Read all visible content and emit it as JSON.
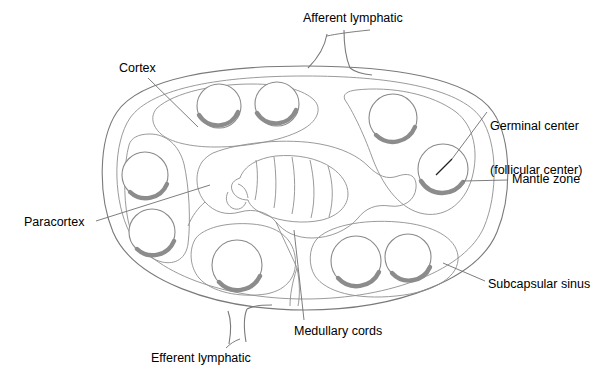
{
  "figure": {
    "background_color": "#ffffff",
    "outline_color": "#7a7a7a",
    "shading_color": "#8c8c8c",
    "text_color": "#000000"
  },
  "labels": {
    "afferent_lymphatic": "Afferent lymphatic",
    "cortex": "Cortex",
    "germinal_center_line1": "Germinal center",
    "germinal_center_line2": "(follicular center)",
    "mantle_zone": "Mantle zone",
    "paracortex": "Paracortex",
    "subcapsular_sinus": "Subcapsular sinus",
    "medullary_cords": "Medullary cords",
    "efferent_lymphatic": "Efferent lymphatic"
  },
  "structures": {
    "capsule": "outer oval capsule",
    "subcapsular_sinus": "inner oval just beneath capsule",
    "cortex_lobes": 4,
    "follicles": 9,
    "medulla": "central branching medullary cords",
    "afferent_vessel": "funnel at top",
    "efferent_vessel": "funnel at bottom"
  },
  "follicles": [
    {
      "id": "follicle-top-left-1",
      "cx": 219,
      "cy": 106,
      "r": 22
    },
    {
      "id": "follicle-top-left-2",
      "cx": 277,
      "cy": 104,
      "r": 22
    },
    {
      "id": "follicle-left-upper",
      "cx": 145,
      "cy": 175,
      "r": 23
    },
    {
      "id": "follicle-left-lower",
      "cx": 152,
      "cy": 232,
      "r": 23
    },
    {
      "id": "follicle-bottom-left",
      "cx": 237,
      "cy": 265,
      "r": 25
    },
    {
      "id": "follicle-right-upper",
      "cx": 393,
      "cy": 118,
      "r": 24
    },
    {
      "id": "follicle-right-lower",
      "cx": 443,
      "cy": 169,
      "r": 25
    },
    {
      "id": "follicle-bottom-mid",
      "cx": 356,
      "cy": 261,
      "r": 25
    },
    {
      "id": "follicle-bottom-right",
      "cx": 408,
      "cy": 257,
      "r": 23
    }
  ]
}
